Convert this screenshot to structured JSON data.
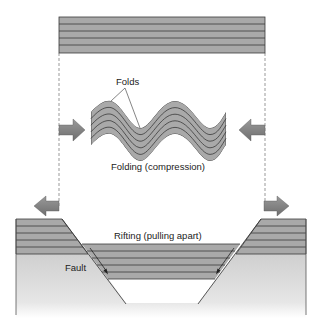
{
  "diagram": {
    "labels": {
      "folds": "Folds",
      "folding": "Folding (compression)",
      "rifting": "Rifting (pulling apart)",
      "fault": "Fault"
    },
    "colors": {
      "strata_fill": "#a9a9a9",
      "strata_line": "#3a3a3a",
      "arrow_fill": "#8a8a8a",
      "ground_fill": "#dcdcdc",
      "dashed_guide": "#555555"
    },
    "panels": [
      {
        "name": "original-strata",
        "layers": 5
      },
      {
        "name": "folded-strata",
        "process": "compression",
        "arrows": [
          "right",
          "left"
        ]
      },
      {
        "name": "rifted-strata",
        "process": "extension",
        "arrows": [
          "left",
          "right"
        ]
      }
    ]
  }
}
